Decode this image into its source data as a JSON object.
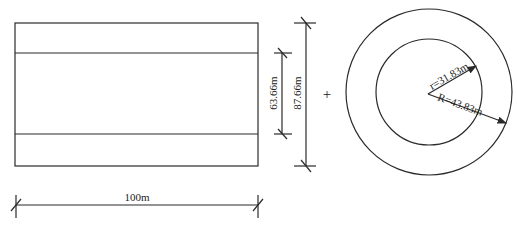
{
  "diagram": {
    "rectangle_view": {
      "width_label": "100m",
      "inner_height_label": "63.66m",
      "outer_height_label": "87.66m"
    },
    "operator": "+",
    "ring_view": {
      "inner_radius_label": "r=31.83m",
      "outer_radius_label": "R=43.83m"
    },
    "colors": {
      "line": "#2a2a2a",
      "background": "#ffffff"
    }
  }
}
